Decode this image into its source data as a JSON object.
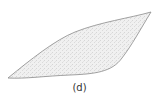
{
  "figure": {
    "caption": "(d)",
    "shape": "lens-shaped region (two curved boundaries meeting at tips)",
    "colors": {
      "fill": "#ececec",
      "stroke": "#8a8a8a",
      "caption": "#333333"
    }
  }
}
